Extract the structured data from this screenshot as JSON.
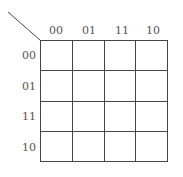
{
  "kmap": {
    "col_labels": [
      "00",
      "01",
      "11",
      "10"
    ],
    "row_labels": [
      "00",
      "01",
      "11",
      "10"
    ],
    "cells": [
      [
        "",
        "",
        "",
        ""
      ],
      [
        "",
        "",
        "",
        ""
      ],
      [
        "",
        "",
        "",
        ""
      ],
      [
        "",
        "",
        "",
        ""
      ]
    ]
  }
}
